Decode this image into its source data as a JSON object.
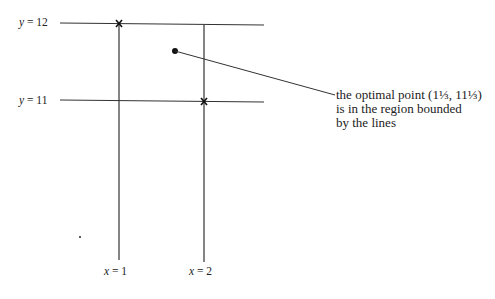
{
  "diagram": {
    "lines": {
      "y12": {
        "label_var": "y",
        "label_eq": " = 12",
        "value": 12
      },
      "y11": {
        "label_var": "y",
        "label_eq": " = 11",
        "value": 11
      },
      "x1": {
        "label_var": "x",
        "label_eq": " = 1",
        "value": 1
      },
      "x2": {
        "label_var": "x",
        "label_eq": " = 2",
        "value": 2
      }
    },
    "annotation": {
      "line1": "the optimal point (1⅓, 11⅓)",
      "line2": "is in the region bounded",
      "line3": "by the lines"
    },
    "markers": [
      "cross at (x=1, y=12)",
      "cross at (x=2, y=11)",
      "dot for optimal point"
    ],
    "colors": {
      "line": "#333333",
      "text": "#222222"
    }
  }
}
